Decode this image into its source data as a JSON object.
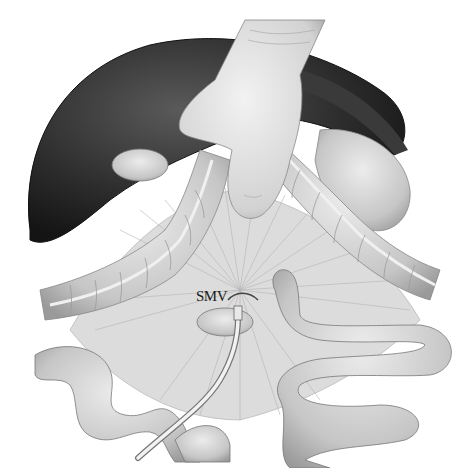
{
  "figure": {
    "type": "surgical anatomy illustration",
    "style": "grayscale pencil/airbrush",
    "labels": [
      {
        "id": "smv",
        "text": "SMV",
        "x": 196,
        "y": 297
      }
    ],
    "structures": [
      "liver",
      "gallbladder",
      "stomach",
      "transverse-colon",
      "gloved-hand",
      "mesentery",
      "small-intestine",
      "catheter"
    ],
    "colors": {
      "background": "#ffffff",
      "liver": "#2b2b2b",
      "tissue": "#c8c8c8",
      "tissue_light": "#e2e2e2",
      "outline": "#555555",
      "text": "#1a1a1a"
    }
  }
}
